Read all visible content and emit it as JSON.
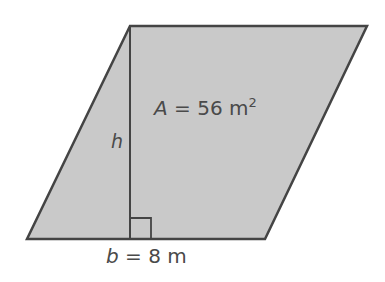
{
  "figure": {
    "shape": "parallelogram",
    "colors": {
      "fill": "#c9c9c9",
      "stroke": "#444444",
      "text": "#4a4a4a",
      "background": "#ffffff"
    },
    "vertices": {
      "top_left": [
        130,
        26
      ],
      "top_right": [
        367,
        26
      ],
      "bottom_right": [
        265,
        239
      ],
      "bottom_left": [
        27,
        239
      ]
    },
    "height_segment": {
      "x": 130,
      "y_top": 26,
      "y_bottom": 239,
      "label": "h"
    },
    "right_angle_marker": {
      "x": 130,
      "y": 218,
      "size": 21
    },
    "area_label": {
      "variable": "A",
      "equals": " = 56 m",
      "superscript": "2"
    },
    "base_label": {
      "variable": "b",
      "equals": " = 8 m"
    }
  }
}
